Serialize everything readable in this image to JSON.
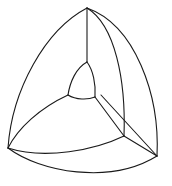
{
  "diagram": {
    "stroke_color": "#1a1a1a",
    "background": "#ffffff",
    "vertices": {
      "top": [
        87,
        8
      ],
      "left": [
        8,
        148
      ],
      "right": [
        157,
        156
      ],
      "inner_corner": [
        124,
        136
      ],
      "cap_top": [
        87,
        62
      ],
      "cap_left": [
        68,
        95
      ],
      "cap_right": [
        95,
        97
      ]
    }
  }
}
